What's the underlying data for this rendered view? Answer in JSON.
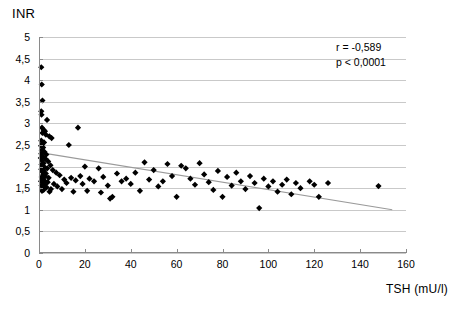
{
  "chart_data": {
    "type": "scatter",
    "title": "",
    "xlabel": "TSH (mU/l)",
    "ylabel": "INR",
    "xlim": [
      0,
      160
    ],
    "ylim": [
      0,
      5
    ],
    "xticks": [
      "0",
      "20",
      "40",
      "60",
      "80",
      "100",
      "120",
      "140",
      "160"
    ],
    "xtick_values": [
      0,
      20,
      40,
      60,
      80,
      100,
      120,
      140,
      160
    ],
    "yticks": [
      "0",
      "0,5",
      "1",
      "1,5",
      "2",
      "2,5",
      "3",
      "3,5",
      "4",
      "4,5",
      "5"
    ],
    "ytick_values": [
      0,
      0.5,
      1,
      1.5,
      2,
      2.5,
      3,
      3.5,
      4,
      4.5,
      5
    ],
    "grid": "horizontal",
    "legend": "none",
    "marker": "diamond",
    "marker_color": "#000000",
    "trendline": {
      "type": "linear",
      "color": "#9a9a9a",
      "x_start": 0,
      "y_start": 2.33,
      "x_end": 154,
      "y_end": 1.0
    },
    "annotations": [
      {
        "text": "r = -0,589"
      },
      {
        "text": "p < 0,0001"
      }
    ],
    "points": [
      [
        1.0,
        4.3
      ],
      [
        1.2,
        3.9
      ],
      [
        1.5,
        3.53
      ],
      [
        1.0,
        3.28
      ],
      [
        1.1,
        3.2
      ],
      [
        3.5,
        3.08
      ],
      [
        1.3,
        2.9
      ],
      [
        2.0,
        2.85
      ],
      [
        2.6,
        2.82
      ],
      [
        1.5,
        2.78
      ],
      [
        3.0,
        2.74
      ],
      [
        4.5,
        2.7
      ],
      [
        5.5,
        2.66
      ],
      [
        17.0,
        2.9
      ],
      [
        1.0,
        2.6
      ],
      [
        2.2,
        2.56
      ],
      [
        1.4,
        2.52
      ],
      [
        0.9,
        2.48
      ],
      [
        1.8,
        2.44
      ],
      [
        13.0,
        2.5
      ],
      [
        1.2,
        2.38
      ],
      [
        2.4,
        2.34
      ],
      [
        1.0,
        2.3
      ],
      [
        3.2,
        2.28
      ],
      [
        1.6,
        2.24
      ],
      [
        0.8,
        2.2
      ],
      [
        2.8,
        2.18
      ],
      [
        1.3,
        2.14
      ],
      [
        4.0,
        2.12
      ],
      [
        2.0,
        2.08
      ],
      [
        1.1,
        2.05
      ],
      [
        5.0,
        2.03
      ],
      [
        1.7,
        2.0
      ],
      [
        2.5,
        1.98
      ],
      [
        3.6,
        1.96
      ],
      [
        1.0,
        1.94
      ],
      [
        6.0,
        1.92
      ],
      [
        2.1,
        1.9
      ],
      [
        1.4,
        1.88
      ],
      [
        7.5,
        1.86
      ],
      [
        3.0,
        1.84
      ],
      [
        1.9,
        1.82
      ],
      [
        9.0,
        1.8
      ],
      [
        2.7,
        1.78
      ],
      [
        1.2,
        1.76
      ],
      [
        4.2,
        1.74
      ],
      [
        1.5,
        1.72
      ],
      [
        11.0,
        1.7
      ],
      [
        2.3,
        1.68
      ],
      [
        0.9,
        1.66
      ],
      [
        3.8,
        1.64
      ],
      [
        1.8,
        1.62
      ],
      [
        6.5,
        1.6
      ],
      [
        2.6,
        1.58
      ],
      [
        1.1,
        1.56
      ],
      [
        8.0,
        1.54
      ],
      [
        3.3,
        1.52
      ],
      [
        1.6,
        1.5
      ],
      [
        5.2,
        1.48
      ],
      [
        2.0,
        1.46
      ],
      [
        1.3,
        1.44
      ],
      [
        4.6,
        1.42
      ],
      [
        14.0,
        1.74
      ],
      [
        16.0,
        1.68
      ],
      [
        12.0,
        1.62
      ],
      [
        10.0,
        1.48
      ],
      [
        15.0,
        1.42
      ],
      [
        18.0,
        1.78
      ],
      [
        20.0,
        2.0
      ],
      [
        19.0,
        1.6
      ],
      [
        22.0,
        1.72
      ],
      [
        24.0,
        1.66
      ],
      [
        21.0,
        1.44
      ],
      [
        26.0,
        1.96
      ],
      [
        28.0,
        1.76
      ],
      [
        30.0,
        1.56
      ],
      [
        27.0,
        1.4
      ],
      [
        32.0,
        1.3
      ],
      [
        34.0,
        1.84
      ],
      [
        36.0,
        1.66
      ],
      [
        31.0,
        1.26
      ],
      [
        38.0,
        1.72
      ],
      [
        40.0,
        1.6
      ],
      [
        42.0,
        1.86
      ],
      [
        44.0,
        1.44
      ],
      [
        46.0,
        2.1
      ],
      [
        48.0,
        1.7
      ],
      [
        50.0,
        1.92
      ],
      [
        52.0,
        1.54
      ],
      [
        54.0,
        1.66
      ],
      [
        56.0,
        2.06
      ],
      [
        58.0,
        1.78
      ],
      [
        60.0,
        1.3
      ],
      [
        62.0,
        2.02
      ],
      [
        64.0,
        1.96
      ],
      [
        66.0,
        1.72
      ],
      [
        68.0,
        1.58
      ],
      [
        70.0,
        2.08
      ],
      [
        72.0,
        1.82
      ],
      [
        74.0,
        1.64
      ],
      [
        76.0,
        1.46
      ],
      [
        78.0,
        1.9
      ],
      [
        80.0,
        1.3
      ],
      [
        82.0,
        1.76
      ],
      [
        84.0,
        1.56
      ],
      [
        86.0,
        1.86
      ],
      [
        88.0,
        1.66
      ],
      [
        90.0,
        1.48
      ],
      [
        92.0,
        1.78
      ],
      [
        94.0,
        1.62
      ],
      [
        96.0,
        1.04
      ],
      [
        98.0,
        1.72
      ],
      [
        100.0,
        1.54
      ],
      [
        102.0,
        1.66
      ],
      [
        104.0,
        1.42
      ],
      [
        106.0,
        1.58
      ],
      [
        108.0,
        1.7
      ],
      [
        110.0,
        1.36
      ],
      [
        112.0,
        1.62
      ],
      [
        114.0,
        1.5
      ],
      [
        118.0,
        1.66
      ],
      [
        120.0,
        1.58
      ],
      [
        122.0,
        1.3
      ],
      [
        126.0,
        1.62
      ],
      [
        148.0,
        1.55
      ]
    ]
  }
}
